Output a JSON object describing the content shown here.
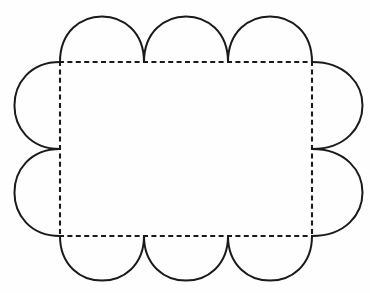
{
  "figure": {
    "title": "Scalloped net of a cube-like solid",
    "background_color": "#fefefe",
    "stroke_color": "#1a1a1a",
    "stroke_width": 2,
    "dash_stroke_width": 2.1,
    "dash_pattern": "5,3.4",
    "rectangle": {
      "name": "inner-dashed-rectangle",
      "x": 60,
      "y": 62,
      "width": 252,
      "height": 174,
      "right": 312,
      "bottom": 236,
      "style": "dashed"
    },
    "scallops": {
      "top": {
        "count": 3,
        "segment_width": 84,
        "bulge": 46,
        "peak_y": 16,
        "cusp_x": [
          144,
          228
        ],
        "style": "solid"
      },
      "bottom": {
        "count": 3,
        "segment_width": 84,
        "bulge": 45,
        "peak_y": 281,
        "cusp_x": [
          144,
          228
        ],
        "style": "solid"
      },
      "left": {
        "count": 2,
        "segment_height": 87,
        "bulge": 46,
        "peak_x": 14,
        "cusp_y": [
          149
        ],
        "style": "solid"
      },
      "right": {
        "count": 2,
        "segment_height": 87,
        "bulge": 51,
        "peak_x": 363,
        "cusp_y": [
          149
        ],
        "style": "solid"
      }
    },
    "canvas": {
      "width": 370,
      "height": 293
    }
  }
}
